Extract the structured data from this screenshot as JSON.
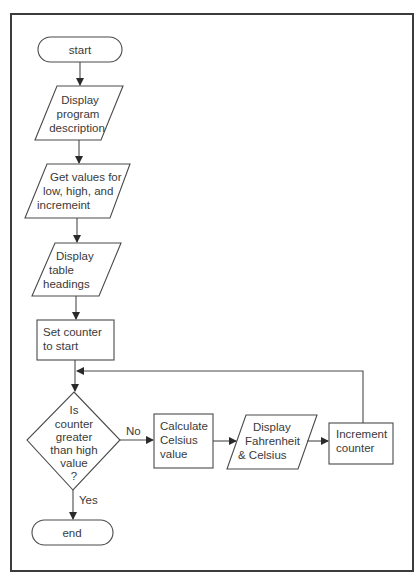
{
  "diagram": {
    "type": "flowchart",
    "nodes": {
      "start": {
        "shape": "terminal",
        "lines": [
          "start"
        ]
      },
      "display_desc": {
        "shape": "parallelogram",
        "lines": [
          "Display",
          "program",
          "description"
        ]
      },
      "get_values": {
        "shape": "parallelogram",
        "lines": [
          "Get values for",
          "low, high, and",
          "incremeint"
        ]
      },
      "display_headings": {
        "shape": "parallelogram",
        "lines": [
          "Display",
          "table",
          "headings"
        ]
      },
      "set_counter": {
        "shape": "process",
        "lines": [
          "Set counter",
          "to start"
        ]
      },
      "decision": {
        "shape": "decision",
        "lines": [
          "Is",
          "counter",
          "greater",
          "than high",
          "value",
          "?"
        ]
      },
      "calculate": {
        "shape": "process",
        "lines": [
          "Calculate",
          "Celsius",
          "value"
        ]
      },
      "display_fc": {
        "shape": "parallelogram",
        "lines": [
          "Display",
          "Fahrenheit",
          "& Celsius"
        ]
      },
      "increment": {
        "shape": "process",
        "lines": [
          "Increment",
          "counter"
        ]
      },
      "end": {
        "shape": "terminal",
        "lines": [
          "end"
        ]
      }
    },
    "edges": {
      "no_label": "No",
      "yes_label": "Yes"
    },
    "colors": {
      "stroke": "#4a4a4a",
      "text": "#3a3a3a",
      "background": "#ffffff"
    }
  }
}
